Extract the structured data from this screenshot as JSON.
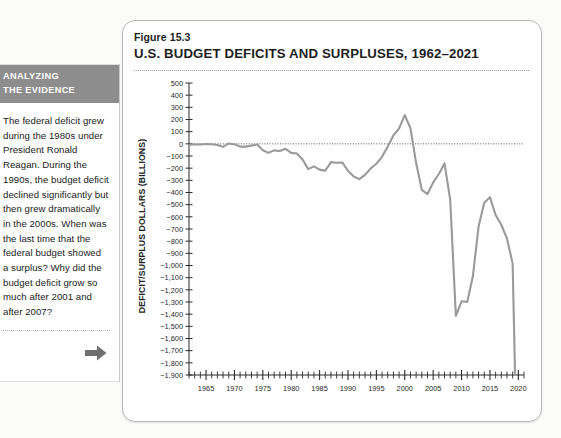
{
  "sidebar": {
    "header_line1": "ANALYZING",
    "header_line2": "THE EVIDENCE",
    "body": "The federal deficit grew during the 1980s under President Ronald Reagan. During the 1990s, the budget deficit declined significantly but then grew dramatically in the 2000s. When was the last time that the federal budget showed a surplus? Why did the budget deficit grow so much after 2001 and after 2007?",
    "arrow_icon": "arrow-right-icon",
    "header_bg": "#8d8d8d",
    "header_color": "#ffffff"
  },
  "figure": {
    "number": "Figure 15.3",
    "title": "U.S. BUDGET DEFICITS AND SURPLUSES, 1962–2021"
  },
  "chart_data": {
    "type": "line",
    "title": "U.S. BUDGET DEFICITS AND SURPLUSES, 1962–2021",
    "xlabel": "",
    "ylabel": "DEFICIT/SURPLUS DOLLARS (BILLIONS)",
    "xlim": [
      1962,
      2021
    ],
    "ylim": [
      -1900,
      500
    ],
    "ytick_step": 100,
    "grid": false,
    "zero_line": true,
    "legend": "none",
    "line_color": "#9a9a9a",
    "ytick_labels": [
      "500",
      "400",
      "300",
      "200",
      "100",
      "0",
      "−100",
      "−200",
      "−300",
      "−400",
      "−500",
      "−600",
      "−700",
      "−800",
      "−900",
      "−1,000",
      "−1,100",
      "−1,200",
      "−1,300",
      "−1,400",
      "−1,500",
      "−1,600",
      "−1,700",
      "−1,800",
      "−1,900"
    ],
    "ytick_values": [
      500,
      400,
      300,
      200,
      100,
      0,
      -100,
      -200,
      -300,
      -400,
      -500,
      -600,
      -700,
      -800,
      -900,
      -1000,
      -1100,
      -1200,
      -1300,
      -1400,
      -1500,
      -1600,
      -1700,
      -1800,
      -1900
    ],
    "xtick_labels": [
      "1965",
      "1970",
      "1975",
      "1980",
      "1985",
      "1990",
      "1995",
      "2000",
      "2005",
      "2010",
      "2015",
      "2020"
    ],
    "xtick_values": [
      1965,
      1970,
      1975,
      1980,
      1985,
      1990,
      1995,
      2000,
      2005,
      2010,
      2015,
      2020
    ],
    "x": [
      1962,
      1963,
      1964,
      1965,
      1966,
      1967,
      1968,
      1969,
      1970,
      1971,
      1972,
      1973,
      1974,
      1975,
      1976,
      1977,
      1978,
      1979,
      1980,
      1981,
      1982,
      1983,
      1984,
      1985,
      1986,
      1987,
      1988,
      1989,
      1990,
      1991,
      1992,
      1993,
      1994,
      1995,
      1996,
      1997,
      1998,
      1999,
      2000,
      2001,
      2002,
      2003,
      2004,
      2005,
      2006,
      2007,
      2008,
      2009,
      2010,
      2011,
      2012,
      2013,
      2014,
      2015,
      2016,
      2017,
      2018,
      2019,
      2020,
      2021
    ],
    "values": [
      -7,
      -5,
      -6,
      -1,
      -4,
      -9,
      -25,
      3,
      -3,
      -23,
      -23,
      -15,
      -6,
      -53,
      -74,
      -54,
      -59,
      -41,
      -74,
      -79,
      -128,
      -208,
      -185,
      -212,
      -221,
      -150,
      -155,
      -153,
      -221,
      -269,
      -290,
      -255,
      -203,
      -164,
      -107,
      -22,
      69,
      126,
      236,
      128,
      -158,
      -378,
      -413,
      -318,
      -248,
      -161,
      -459,
      -1413,
      -1294,
      -1300,
      -1087,
      -680,
      -485,
      -438,
      -585,
      -665,
      -779,
      -984,
      -3132,
      -2775
    ]
  }
}
